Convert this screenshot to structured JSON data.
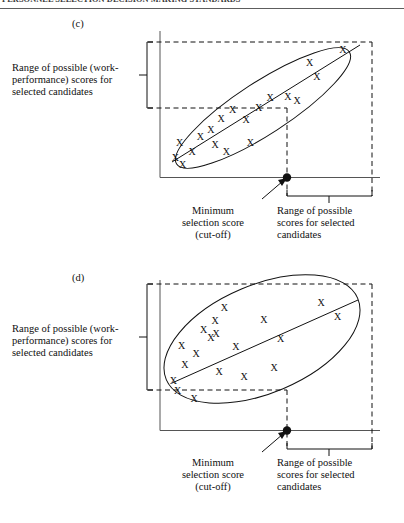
{
  "page": {
    "running_head": "PERSONNEL SELECTION DECISION MAKING STANDARDS",
    "ink": "#111111",
    "rule_color": "#5d5d5d"
  },
  "panels": [
    {
      "id": "c",
      "caption": "(c)",
      "y_axis_label": "Range of possible (work-performance) scores for selected candidates",
      "y_axis_label_lines": [
        "Range of possible (work-",
        "performance) scores for",
        "selected candidates"
      ],
      "cutoff_label_lines": [
        "Minimum",
        "selection score",
        "(cut-off)"
      ],
      "x_range_label_lines": [
        "Range of possible",
        "scores for selected",
        "candidates"
      ],
      "marker_glyph": "X",
      "markers": [
        {
          "x": 0.055,
          "y": 0.905
        },
        {
          "x": 0.09,
          "y": 0.955
        },
        {
          "x": 0.135,
          "y": 0.855
        },
        {
          "x": 0.075,
          "y": 0.79
        },
        {
          "x": 0.175,
          "y": 0.745
        },
        {
          "x": 0.245,
          "y": 0.805
        },
        {
          "x": 0.3,
          "y": 0.855
        },
        {
          "x": 0.225,
          "y": 0.69
        },
        {
          "x": 0.275,
          "y": 0.61
        },
        {
          "x": 0.33,
          "y": 0.545
        },
        {
          "x": 0.415,
          "y": 0.79
        },
        {
          "x": 0.395,
          "y": 0.62
        },
        {
          "x": 0.455,
          "y": 0.53
        },
        {
          "x": 0.51,
          "y": 0.455
        },
        {
          "x": 0.595,
          "y": 0.445
        },
        {
          "x": 0.64,
          "y": 0.48
        },
        {
          "x": 0.735,
          "y": 0.295
        },
        {
          "x": 0.7,
          "y": 0.19
        },
        {
          "x": 0.86,
          "y": 0.095
        }
      ],
      "ellipse": {
        "cx": 0.455,
        "cy": 0.565,
        "rx": 0.47,
        "ry": 0.135,
        "rotate": -33
      },
      "regression_line": {
        "x1": 0.055,
        "y1": 0.925,
        "x2": 0.86,
        "y2": 0.105
      },
      "cutoff_x": 0.565,
      "band_top": 0.03,
      "band_bottom": 0.545
    },
    {
      "id": "d",
      "caption": "(d)",
      "y_axis_label": "Range of possible (work-performance) scores for selected candidates",
      "y_axis_label_lines": [
        "Range of possible (work-",
        "performance) scores for",
        "selected candidates"
      ],
      "cutoff_label_lines": [
        "Minimum",
        "selection score",
        "(cut-off)"
      ],
      "x_range_label_lines": [
        "Range of possible",
        "scores for selected",
        "candidates"
      ],
      "marker_glyph": "X",
      "markers": [
        {
          "x": 0.045,
          "y": 0.7
        },
        {
          "x": 0.065,
          "y": 0.77
        },
        {
          "x": 0.1,
          "y": 0.59
        },
        {
          "x": 0.085,
          "y": 0.46
        },
        {
          "x": 0.145,
          "y": 0.83
        },
        {
          "x": 0.155,
          "y": 0.52
        },
        {
          "x": 0.19,
          "y": 0.35
        },
        {
          "x": 0.225,
          "y": 0.41
        },
        {
          "x": 0.245,
          "y": 0.29
        },
        {
          "x": 0.25,
          "y": 0.38
        },
        {
          "x": 0.265,
          "y": 0.64
        },
        {
          "x": 0.29,
          "y": 0.2
        },
        {
          "x": 0.345,
          "y": 0.47
        },
        {
          "x": 0.385,
          "y": 0.675
        },
        {
          "x": 0.48,
          "y": 0.28
        },
        {
          "x": 0.53,
          "y": 0.61
        },
        {
          "x": 0.56,
          "y": 0.415
        },
        {
          "x": 0.755,
          "y": 0.165
        },
        {
          "x": 0.835,
          "y": 0.265
        }
      ],
      "ellipse": {
        "cx": 0.45,
        "cy": 0.455,
        "rx": 0.475,
        "ry": 0.25,
        "rotate": -23
      },
      "regression_line": {
        "x1": 0.05,
        "y1": 0.715,
        "x2": 0.84,
        "y2": 0.23
      },
      "cutoff_x": 0.565,
      "band_top": 0.03,
      "band_bottom": 0.885
    }
  ]
}
